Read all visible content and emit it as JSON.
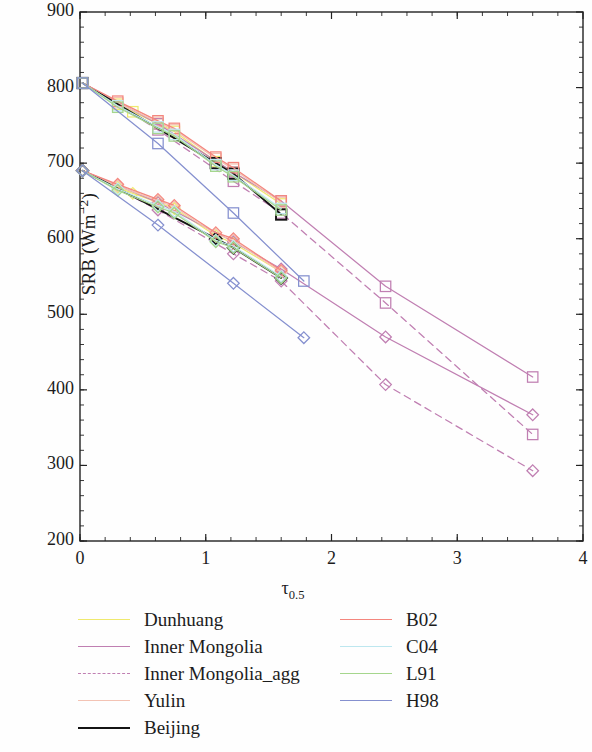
{
  "chart_data": {
    "type": "line",
    "title": "",
    "xlabel": "τ_0.5",
    "xlabel_base": "τ",
    "xlabel_sub": "0.5",
    "ylabel": "SRB (Wm⁻²)",
    "ylabel_base": "SRB (Wm",
    "ylabel_sup": "−2",
    "ylabel_tail": ")",
    "xlim": [
      0,
      4
    ],
    "ylim": [
      200,
      900
    ],
    "xticks": [
      0,
      1,
      2,
      3,
      4
    ],
    "yticks": [
      200,
      300,
      400,
      500,
      600,
      700,
      800,
      900
    ],
    "xtick_labels": [
      "0",
      "1",
      "2",
      "3",
      "4"
    ],
    "ytick_labels": [
      "200",
      "300",
      "400",
      "500",
      "600",
      "700",
      "800",
      "900"
    ],
    "x_minor_per_major": 5,
    "y_minor_per_major": 5,
    "grid": false,
    "legend_position": "below-plot-two-columns",
    "marker_note": "upper branch uses open squares, lower branch uses open diamonds",
    "series": [
      {
        "name": "Dunhuang",
        "color": "#efe96e",
        "dash": "solid",
        "marker": "square",
        "x": [
          0.02,
          0.3,
          0.42,
          0.62,
          0.75,
          1.08,
          1.22,
          1.6
        ],
        "y": [
          806,
          778,
          768,
          752,
          742,
          702,
          688,
          646
        ]
      },
      {
        "name": "Dunhuang",
        "color": "#efe96e",
        "dash": "solid",
        "marker": "diamond",
        "x": [
          0.02,
          0.3,
          0.42,
          0.62,
          0.75,
          1.08,
          1.22,
          1.6
        ],
        "y": [
          690,
          668,
          660,
          648,
          640,
          604,
          594,
          556
        ]
      },
      {
        "name": "Inner Mongolia",
        "color": "#c07fb2",
        "dash": "solid",
        "marker": "square",
        "x": [
          0.02,
          0.62,
          1.22,
          1.6,
          2.43,
          3.6
        ],
        "y": [
          806,
          752,
          688,
          650,
          537,
          417
        ]
      },
      {
        "name": "Inner Mongolia",
        "color": "#c07fb2",
        "dash": "solid",
        "marker": "diamond",
        "x": [
          0.02,
          0.62,
          1.22,
          1.6,
          2.43,
          3.6
        ],
        "y": [
          690,
          648,
          596,
          560,
          470,
          367
        ]
      },
      {
        "name": "Inner Mongolia_agg",
        "color": "#c07fb2",
        "dash": "dashed",
        "marker": "square",
        "x": [
          0.02,
          0.62,
          1.22,
          1.6,
          2.43,
          3.6
        ],
        "y": [
          806,
          744,
          676,
          634,
          515,
          341
        ]
      },
      {
        "name": "Inner Mongolia_agg",
        "color": "#c07fb2",
        "dash": "dashed",
        "marker": "diamond",
        "x": [
          0.02,
          0.62,
          1.22,
          1.6,
          2.43,
          3.6
        ],
        "y": [
          690,
          638,
          580,
          544,
          407,
          293
        ]
      },
      {
        "name": "Yulin",
        "color": "#f3c3b4",
        "dash": "solid",
        "marker": "square",
        "x": [
          0.02,
          0.3,
          0.62,
          0.75,
          1.08,
          1.22,
          1.6
        ],
        "y": [
          806,
          780,
          754,
          744,
          706,
          692,
          648
        ]
      },
      {
        "name": "Yulin",
        "color": "#f3c3b4",
        "dash": "solid",
        "marker": "diamond",
        "x": [
          0.02,
          0.3,
          0.62,
          0.75,
          1.08,
          1.22,
          1.6
        ],
        "y": [
          690,
          670,
          650,
          642,
          606,
          598,
          556
        ]
      },
      {
        "name": "Beijing",
        "color": "#141414",
        "dash": "solid",
        "marker": "square",
        "x": [
          0.02,
          1.08,
          1.22,
          1.6
        ],
        "y": [
          806,
          700,
          686,
          632
        ]
      },
      {
        "name": "Beijing",
        "color": "#141414",
        "dash": "solid",
        "marker": "diamond",
        "x": [
          0.02,
          1.08,
          1.22,
          1.6
        ],
        "y": [
          690,
          600,
          588,
          548
        ]
      },
      {
        "name": "B02",
        "color": "#f4867e",
        "dash": "solid",
        "marker": "square",
        "x": [
          0.02,
          0.3,
          0.62,
          0.75,
          1.08,
          1.22,
          1.6
        ],
        "y": [
          806,
          782,
          756,
          746,
          708,
          694,
          650
        ]
      },
      {
        "name": "B02",
        "color": "#f4867e",
        "dash": "solid",
        "marker": "diamond",
        "x": [
          0.02,
          0.3,
          0.62,
          0.75,
          1.08,
          1.22,
          1.6
        ],
        "y": [
          690,
          672,
          652,
          644,
          608,
          600,
          558
        ]
      },
      {
        "name": "C04",
        "color": "#bde7ef",
        "dash": "solid",
        "marker": "square",
        "x": [
          0.02,
          0.3,
          0.62,
          0.75,
          1.08,
          1.22,
          1.6
        ],
        "y": [
          806,
          776,
          748,
          738,
          698,
          684,
          640
        ]
      },
      {
        "name": "C04",
        "color": "#bde7ef",
        "dash": "solid",
        "marker": "diamond",
        "x": [
          0.02,
          0.3,
          0.62,
          0.75,
          1.08,
          1.22,
          1.6
        ],
        "y": [
          690,
          666,
          644,
          636,
          598,
          590,
          550
        ]
      },
      {
        "name": "L91",
        "color": "#a5d68d",
        "dash": "solid",
        "marker": "square",
        "x": [
          0.02,
          0.3,
          0.62,
          0.75,
          1.08,
          1.22,
          1.6
        ],
        "y": [
          806,
          774,
          746,
          736,
          696,
          682,
          638
        ]
      },
      {
        "name": "L91",
        "color": "#a5d68d",
        "dash": "solid",
        "marker": "diamond",
        "x": [
          0.02,
          0.3,
          0.62,
          0.75,
          1.08,
          1.22,
          1.6
        ],
        "y": [
          690,
          664,
          642,
          634,
          596,
          588,
          548
        ]
      },
      {
        "name": "H98",
        "color": "#8590cf",
        "dash": "solid",
        "marker": "square",
        "x": [
          0.02,
          0.62,
          1.22,
          1.78
        ],
        "y": [
          806,
          726,
          634,
          544
        ]
      },
      {
        "name": "H98",
        "color": "#8590cf",
        "dash": "solid",
        "marker": "diamond",
        "x": [
          0.02,
          0.62,
          1.22,
          1.78
        ],
        "y": [
          690,
          618,
          541,
          469
        ]
      }
    ]
  },
  "legend": {
    "left_column": [
      {
        "label": "Dunhuang",
        "color": "#efe96e",
        "dash": "solid"
      },
      {
        "label": "Inner Mongolia",
        "color": "#c07fb2",
        "dash": "solid"
      },
      {
        "label": "Inner Mongolia_agg",
        "color": "#c07fb2",
        "dash": "dashed"
      },
      {
        "label": "Yulin",
        "color": "#f3c3b4",
        "dash": "solid"
      },
      {
        "label": "Beijing",
        "color": "#141414",
        "dash": "solid"
      }
    ],
    "right_column": [
      {
        "label": "B02",
        "color": "#f4867e",
        "dash": "solid"
      },
      {
        "label": "C04",
        "color": "#bde7ef",
        "dash": "solid"
      },
      {
        "label": "L91",
        "color": "#a5d68d",
        "dash": "solid"
      },
      {
        "label": "H98",
        "color": "#8590cf",
        "dash": "solid"
      }
    ]
  }
}
